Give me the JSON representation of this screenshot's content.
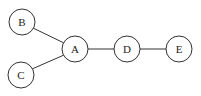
{
  "diagram": {
    "type": "graph",
    "directed": false,
    "nodes": [
      {
        "id": "B",
        "label": "B",
        "cx": 22,
        "cy": 22,
        "r": 13
      },
      {
        "id": "C",
        "label": "C",
        "cx": 21,
        "cy": 75,
        "r": 13
      },
      {
        "id": "A",
        "label": "A",
        "cx": 75,
        "cy": 49,
        "r": 13
      },
      {
        "id": "D",
        "label": "D",
        "cx": 127,
        "cy": 49,
        "r": 13
      },
      {
        "id": "E",
        "label": "E",
        "cx": 179,
        "cy": 49,
        "r": 13
      }
    ],
    "edges": [
      {
        "from": "B",
        "to": "A"
      },
      {
        "from": "C",
        "to": "A"
      },
      {
        "from": "A",
        "to": "D"
      },
      {
        "from": "D",
        "to": "E"
      }
    ],
    "colors": {
      "stroke": "#333333",
      "fill": "#ffffff",
      "text": "#222222"
    }
  }
}
